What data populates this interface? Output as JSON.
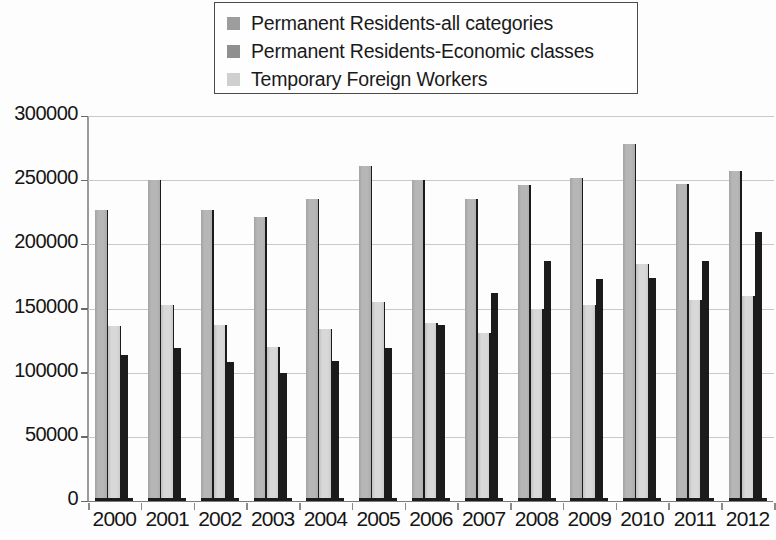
{
  "chart_data": {
    "type": "bar",
    "title": "",
    "subtitle": "",
    "xlabel": "",
    "ylabel": "",
    "grid": true,
    "legend_position": "top-center",
    "ylim": [
      0,
      300000
    ],
    "ytick_step": 50000,
    "yticks": [
      "300000",
      "250000",
      "200000",
      "150000",
      "100000",
      "50000",
      "0"
    ],
    "categories": [
      "2000",
      "2001",
      "2002",
      "2003",
      "2004",
      "2005",
      "2006",
      "2007",
      "2008",
      "2009",
      "2010",
      "2011",
      "2012"
    ],
    "series": [
      {
        "name": "Permanent Residents-all categories",
        "color": "#b6b6b6",
        "values": [
          227000,
          250000,
          227000,
          221000,
          235000,
          261000,
          250000,
          235000,
          246000,
          252000,
          278000,
          247000,
          257000
        ]
      },
      {
        "name": "Permanent Residents-Economic classes",
        "color": "#d8d8d8",
        "values": [
          136000,
          153000,
          137000,
          120000,
          134000,
          155000,
          139000,
          131000,
          150000,
          153000,
          185000,
          157000,
          160000
        ]
      },
      {
        "name": "Temporary Foreign Workers",
        "color": "#1b1b1b",
        "values": [
          114000,
          119000,
          108000,
          100000,
          109000,
          119000,
          137000,
          162000,
          187000,
          173000,
          174000,
          187000,
          210000
        ]
      }
    ]
  },
  "legend": {
    "items": [
      {
        "label": "Permanent Residents-all categories",
        "swatch": "#9d9d9d"
      },
      {
        "label": "Permanent Residents-Economic classes",
        "swatch": "#8f8f8f"
      },
      {
        "label": "Temporary Foreign Workers",
        "swatch": "#cfcfcf"
      }
    ]
  }
}
